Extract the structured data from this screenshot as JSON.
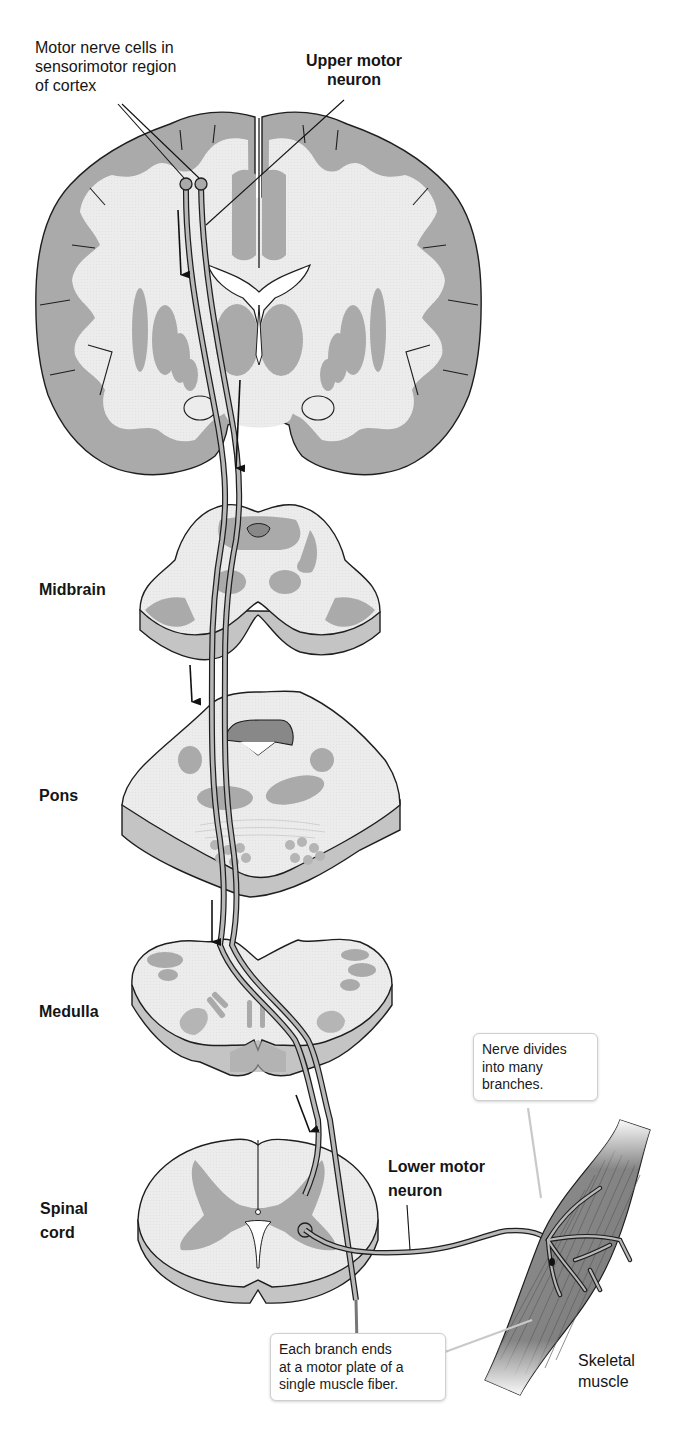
{
  "figure": {
    "labels": {
      "cortex_cells": [
        "Motor nerve cells in",
        "sensorimotor region",
        "of cortex"
      ],
      "upper_motor_neuron": [
        "Upper motor",
        "neuron"
      ],
      "midbrain": "Midbrain",
      "pons": "Pons",
      "medulla": "Medulla",
      "spinal_cord": [
        "Spinal",
        "cord"
      ],
      "lower_motor_neuron": [
        "Lower motor",
        "neuron"
      ],
      "skeletal_muscle": [
        "Skeletal",
        "muscle"
      ]
    },
    "callouts": {
      "nerve_divides": [
        "Nerve divides",
        "into many",
        "branches."
      ],
      "branch_ends": [
        "Each branch ends",
        "at a motor plate of a",
        "single muscle fiber."
      ]
    },
    "colors": {
      "white_matter": "#ebebeb",
      "gray_matter": "#a9a9a9",
      "slab_side": "#c4c4c4",
      "outline": "#1e1e1e",
      "muscle": "#8a8a8a",
      "background": "#ffffff"
    }
  }
}
